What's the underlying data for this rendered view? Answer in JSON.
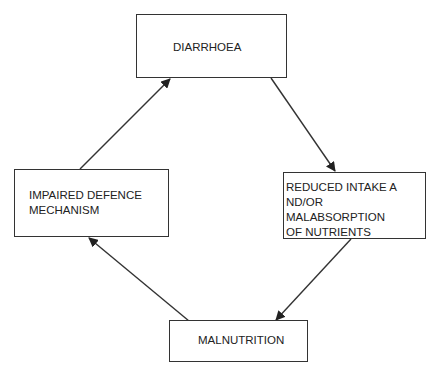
{
  "diagram": {
    "type": "cycle",
    "nodes": [
      {
        "id": "diarrhoea",
        "label": "DIARRHOEA"
      },
      {
        "id": "reduced_intake",
        "label": "REDUCED INTAKE A\nND/OR MALABSORPTION\nOF NUTRIENTS"
      },
      {
        "id": "malnutrition",
        "label": "MALNUTRITION"
      },
      {
        "id": "impaired_defence",
        "label": "IMPAIRED DEFENCE\nMECHANISM"
      }
    ],
    "edges": [
      {
        "from": "diarrhoea",
        "to": "reduced_intake"
      },
      {
        "from": "reduced_intake",
        "to": "malnutrition"
      },
      {
        "from": "malnutrition",
        "to": "impaired_defence"
      },
      {
        "from": "impaired_defence",
        "to": "diarrhoea"
      }
    ],
    "colors": {
      "line": "#333333",
      "background": "#ffffff",
      "text": "#222222"
    }
  }
}
